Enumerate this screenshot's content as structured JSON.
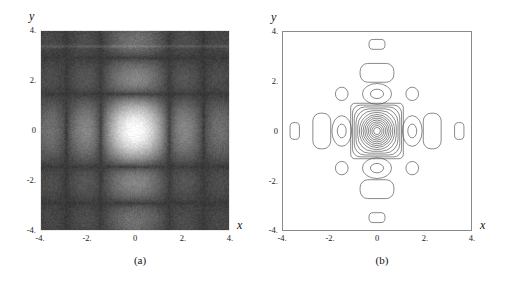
{
  "figure": {
    "panels": [
      {
        "id": "a",
        "caption": "(a)",
        "type": "density",
        "xlabel": "x",
        "ylabel": "y",
        "xticks": [
          "-4.",
          "-2.",
          "0",
          "2.",
          "4."
        ],
        "yticks": [
          "4.",
          "2.",
          "0",
          "-2.",
          "-4."
        ]
      },
      {
        "id": "b",
        "caption": "(b)",
        "type": "contour",
        "xlabel": "x",
        "ylabel": "y",
        "xticks": [
          "-4.",
          "-2.",
          "0",
          "2.",
          "4."
        ],
        "yticks": [
          "4.",
          "2.",
          "0",
          "-2.",
          "-4."
        ]
      }
    ]
  },
  "chart_data": [
    {
      "type": "heatmap",
      "title": "",
      "subtitle": "",
      "xlabel": "x",
      "ylabel": "y",
      "xlim": [
        -4,
        4
      ],
      "ylim": [
        -4,
        4
      ],
      "xticks": [
        -4,
        -2,
        0,
        2,
        4
      ],
      "yticks": [
        -4,
        -2,
        0,
        2,
        4
      ],
      "xticklabels": [
        "-4.",
        "-2.",
        "0",
        "2.",
        "4."
      ],
      "yticklabels": [
        "-4.",
        "-2.",
        "0",
        "2.",
        "4."
      ],
      "grid": false,
      "legend": null,
      "colormap": "grayscale",
      "background_level": 0.22,
      "peak_level": 1.0,
      "peak_center": [
        0,
        0
      ],
      "peak_halfwidth": 0.75,
      "description": "Grayscale density plot of a separable sinc-like product function; bright central maximum at origin with dark first-order nulls and faint secondary side lobes along the x and y axes; speckled noise texture overlays the field.",
      "features": [
        {
          "name": "central-peak",
          "x": 0,
          "y": 0,
          "level": 1.0
        },
        {
          "name": "dark-null-right",
          "x": 1.5,
          "y": 0,
          "level": 0.05
        },
        {
          "name": "dark-null-left",
          "x": -1.5,
          "y": 0,
          "level": 0.05
        },
        {
          "name": "dark-null-top",
          "x": 0,
          "y": 1.5,
          "level": 0.05
        },
        {
          "name": "dark-null-bottom",
          "x": 0,
          "y": -1.5,
          "level": 0.05
        },
        {
          "name": "side-lobe-right",
          "x": 2.4,
          "y": 0,
          "level": 0.33
        },
        {
          "name": "side-lobe-left",
          "x": -2.4,
          "y": 0,
          "level": 0.33
        },
        {
          "name": "side-lobe-top",
          "x": 0,
          "y": 2.4,
          "level": 0.33
        },
        {
          "name": "side-lobe-bottom",
          "x": 0,
          "y": -2.4,
          "level": 0.33
        },
        {
          "name": "band-artifact",
          "x": 0,
          "y": 3.4,
          "level": 0.28
        }
      ]
    },
    {
      "type": "line",
      "title": "",
      "subtitle": "",
      "xlabel": "x",
      "ylabel": "y",
      "xlim": [
        -4,
        4
      ],
      "ylim": [
        -4,
        4
      ],
      "xticks": [
        -4,
        -2,
        0,
        2,
        4
      ],
      "yticks": [
        -4,
        -2,
        0,
        2,
        4
      ],
      "xticklabels": [
        "-4.",
        "-2.",
        "0",
        "2.",
        "4."
      ],
      "yticklabels": [
        "-4.",
        "-2.",
        "0",
        "2.",
        "4."
      ],
      "grid": false,
      "legend": null,
      "description": "Contour plot of the same function as panel (a): a dense nest of ~14 concentric rounded-square contours about the origin spanning |x|,|y| < 1.1, surrounded by closed satellite lobes on the axes and small circular lobes at the diagonal positions.",
      "contour_groups": [
        {
          "name": "central-nest",
          "cx": 0,
          "cy": 0,
          "rings": 14,
          "outer_rx": 1.05,
          "outer_ry": 1.05,
          "shape": "rounded-square"
        },
        {
          "name": "lobe-right-1",
          "cx": 1.5,
          "cy": 0,
          "rings": 2,
          "outer_rx": 0.42,
          "outer_ry": 0.62,
          "shape": "oval"
        },
        {
          "name": "lobe-left-1",
          "cx": -1.5,
          "cy": 0,
          "rings": 2,
          "outer_rx": 0.42,
          "outer_ry": 0.62,
          "shape": "oval"
        },
        {
          "name": "lobe-top-1",
          "cx": 0,
          "cy": 1.5,
          "rings": 2,
          "outer_rx": 0.62,
          "outer_ry": 0.42,
          "shape": "oval"
        },
        {
          "name": "lobe-bottom-1",
          "cx": 0,
          "cy": -1.5,
          "rings": 2,
          "outer_rx": 0.62,
          "outer_ry": 0.42,
          "shape": "oval"
        },
        {
          "name": "lobe-right-2",
          "cx": 2.35,
          "cy": 0,
          "rings": 1,
          "outer_rx": 0.38,
          "outer_ry": 0.72,
          "shape": "oval"
        },
        {
          "name": "lobe-left-2",
          "cx": -2.35,
          "cy": 0,
          "rings": 1,
          "outer_rx": 0.38,
          "outer_ry": 0.72,
          "shape": "oval"
        },
        {
          "name": "lobe-top-2",
          "cx": 0,
          "cy": 2.35,
          "rings": 1,
          "outer_rx": 0.72,
          "outer_ry": 0.38,
          "shape": "oval"
        },
        {
          "name": "lobe-bottom-2",
          "cx": 0,
          "cy": -2.35,
          "rings": 1,
          "outer_rx": 0.72,
          "outer_ry": 0.38,
          "shape": "oval"
        },
        {
          "name": "lobe-right-3",
          "cx": 3.5,
          "cy": 0,
          "rings": 1,
          "outer_rx": 0.2,
          "outer_ry": 0.34,
          "shape": "oval"
        },
        {
          "name": "lobe-left-3",
          "cx": -3.5,
          "cy": 0,
          "rings": 1,
          "outer_rx": 0.2,
          "outer_ry": 0.34,
          "shape": "oval"
        },
        {
          "name": "lobe-top-3",
          "cx": 0,
          "cy": 3.5,
          "rings": 1,
          "outer_rx": 0.34,
          "outer_ry": 0.2,
          "shape": "oval"
        },
        {
          "name": "lobe-bottom-3",
          "cx": 0,
          "cy": -3.5,
          "rings": 1,
          "outer_rx": 0.34,
          "outer_ry": 0.2,
          "shape": "oval"
        },
        {
          "name": "lobe-diag-pp",
          "cx": 1.5,
          "cy": 1.5,
          "rings": 1,
          "outer_rx": 0.27,
          "outer_ry": 0.27,
          "shape": "circle"
        },
        {
          "name": "lobe-diag-mp",
          "cx": -1.5,
          "cy": 1.5,
          "rings": 1,
          "outer_rx": 0.27,
          "outer_ry": 0.27,
          "shape": "circle"
        },
        {
          "name": "lobe-diag-pm",
          "cx": 1.5,
          "cy": -1.5,
          "rings": 1,
          "outer_rx": 0.27,
          "outer_ry": 0.27,
          "shape": "circle"
        },
        {
          "name": "lobe-diag-mm",
          "cx": -1.5,
          "cy": -1.5,
          "rings": 1,
          "outer_rx": 0.27,
          "outer_ry": 0.27,
          "shape": "circle"
        }
      ]
    }
  ],
  "colors": {
    "background": "#ffffff",
    "density_background": "#3b3b3b",
    "density_peak": "#ffffff",
    "contour_line": "#555555",
    "frame": "#8a8a8a",
    "text": "#111111"
  }
}
